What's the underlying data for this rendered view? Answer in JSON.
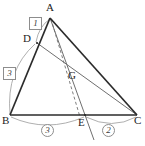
{
  "figure": {
    "type": "geometry-diagram",
    "background": "#ffffff",
    "stroke_dark": "#2b2b2b",
    "stroke_mid": "#6f6f6f",
    "stroke_light": "#9a9a9a",
    "label_color": "#232323"
  },
  "points": [
    {
      "id": "A",
      "label": "A",
      "x": 50,
      "y": 18,
      "label_x": 46,
      "label_y": 2
    },
    {
      "id": "B",
      "label": "B",
      "x": 10,
      "y": 115,
      "label_x": 2,
      "label_y": 117
    },
    {
      "id": "C",
      "label": "C",
      "x": 137,
      "y": 115,
      "label_x": 135,
      "label_y": 117
    },
    {
      "id": "D",
      "label": "D",
      "x": 37,
      "y": 43,
      "label_x": 24,
      "label_y": 34
    },
    {
      "id": "E",
      "label": "E",
      "x": 85,
      "y": 115,
      "label_x": 80,
      "label_y": 117
    },
    {
      "id": "G",
      "label": "G",
      "x": 72,
      "y": 78,
      "label_x": 70,
      "label_y": 72
    }
  ],
  "segments": [
    {
      "name": "AB",
      "from": "A",
      "to": "B",
      "style": "solid",
      "weight": "dark"
    },
    {
      "name": "AC",
      "from": "A",
      "to": "C",
      "style": "solid",
      "weight": "dark"
    },
    {
      "name": "BC",
      "from": "B",
      "to": "C",
      "style": "solid",
      "weight": "dark"
    },
    {
      "name": "AE",
      "from": "A",
      "to": "E",
      "style": "solid",
      "weight": "mid"
    },
    {
      "name": "DC",
      "from": "D",
      "to": "C",
      "style": "solid",
      "weight": "mid"
    },
    {
      "name": "AE-extension",
      "from": "E",
      "to": "beyond",
      "style": "solid",
      "weight": "mid"
    },
    {
      "name": "A-to-E-dashed",
      "from": "A",
      "to": "E",
      "style": "dashed",
      "weight": "mid"
    }
  ],
  "ratio_labels": [
    {
      "id": "ad-ratio",
      "value": "1",
      "shape": "box",
      "on": "AD",
      "x": 29,
      "y": 17
    },
    {
      "id": "db-ratio",
      "value": "3",
      "shape": "box",
      "on": "DB",
      "x": 4,
      "y": 67
    },
    {
      "id": "be-ratio",
      "value": "3",
      "shape": "circle",
      "on": "BE",
      "x": 41,
      "y": 126
    },
    {
      "id": "ec-ratio",
      "value": "2",
      "shape": "circle",
      "on": "EC",
      "x": 103,
      "y": 126
    }
  ],
  "arcs": [
    {
      "id": "arc-AD",
      "label_ref": "ad-ratio",
      "from": "A",
      "to": "D"
    },
    {
      "id": "arc-DB",
      "label_ref": "db-ratio",
      "from": "D",
      "to": "B"
    },
    {
      "id": "arc-BE",
      "label_ref": "be-ratio",
      "from": "B",
      "to": "E"
    },
    {
      "id": "arc-EC",
      "label_ref": "ec-ratio",
      "from": "E",
      "to": "C"
    }
  ]
}
